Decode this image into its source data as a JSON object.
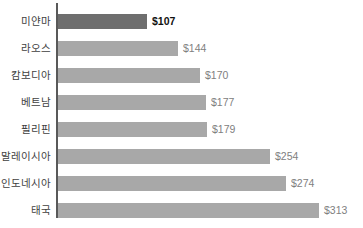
{
  "chart_data": {
    "type": "bar",
    "orientation": "horizontal",
    "title": "",
    "subtitle": "",
    "xlabel": "",
    "ylabel": "",
    "grid": false,
    "legend": false,
    "xlim": [
      0,
      313
    ],
    "categories": [
      "미얀마",
      "라오스",
      "캄보디아",
      "베트남",
      "필리핀",
      "말레이시아",
      "인도네시아",
      "태국"
    ],
    "values": [
      107,
      144,
      170,
      177,
      179,
      254,
      274,
      313
    ],
    "value_labels": [
      "$107",
      "$144",
      "$170",
      "$177",
      "$179",
      "$254",
      "$274",
      "$313"
    ],
    "highlight_index": 0,
    "colors": {
      "bar": "#a8a8a8",
      "bar_highlight": "#6e6e6e",
      "axis": "#595959",
      "category_text": "#3f3f3f",
      "value_text": "#808080",
      "value_text_highlight": "#111111",
      "background": "#ffffff"
    },
    "bars": [
      {
        "category": "미얀마",
        "value": 107,
        "value_label": "$107",
        "highlight": true
      },
      {
        "category": "라오스",
        "value": 144,
        "value_label": "$144",
        "highlight": false
      },
      {
        "category": "캄보디아",
        "value": 170,
        "value_label": "$170",
        "highlight": false
      },
      {
        "category": "베트남",
        "value": 177,
        "value_label": "$177",
        "highlight": false
      },
      {
        "category": "필리핀",
        "value": 179,
        "value_label": "$179",
        "highlight": false
      },
      {
        "category": "말레이시아",
        "value": 254,
        "value_label": "$254",
        "highlight": false
      },
      {
        "category": "인도네시아",
        "value": 274,
        "value_label": "$274",
        "highlight": false
      },
      {
        "category": "태국",
        "value": 313,
        "value_label": "$313",
        "highlight": false
      }
    ]
  }
}
